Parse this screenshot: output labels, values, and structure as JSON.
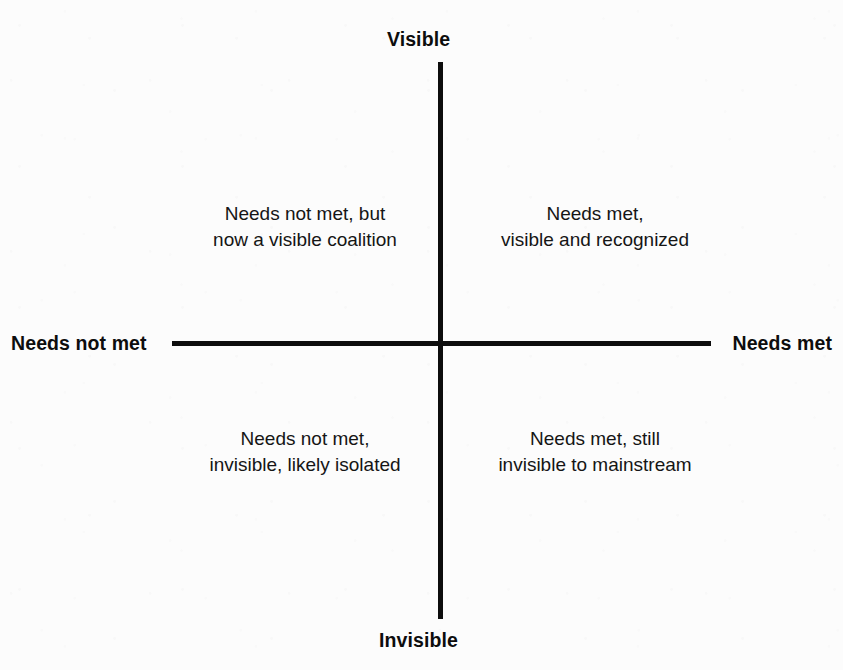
{
  "figure": {
    "kind": "two-by-two-quadrant-diagram",
    "background_color": "#fdfdfd",
    "ink_color": "#0d0d0d"
  },
  "axes": {
    "vertical": {
      "top_label": "Visible",
      "bottom_label": "Invisible"
    },
    "horizontal": {
      "left_label": "Needs not met",
      "right_label": "Needs met"
    }
  },
  "quadrants": {
    "top_left": {
      "line1": "Needs not met, but",
      "line2": "now a visible coalition",
      "text": "Needs not met, but\nnow a visible coalition"
    },
    "top_right": {
      "line1": "Needs met,",
      "line2": "visible and recognized",
      "text": "Needs met,\nvisible and recognized"
    },
    "bottom_left": {
      "line1": "Needs not met,",
      "line2": "invisible, likely isolated",
      "text": "Needs not met,\ninvisible, likely isolated"
    },
    "bottom_right": {
      "line1": "Needs met, still",
      "line2": "invisible to mainstream",
      "text": "Needs met, still\ninvisible to mainstream"
    }
  },
  "chart_data": {
    "type": "scatter",
    "title": "",
    "xlabel": "",
    "ylabel": "",
    "grid": false,
    "legend": null,
    "x_axis": {
      "negative_end_label": "Needs not met",
      "positive_end_label": "Needs met",
      "range": [
        -1,
        1
      ]
    },
    "y_axis": {
      "negative_end_label": "Invisible",
      "positive_end_label": "Visible",
      "range": [
        -1,
        1
      ]
    },
    "annotations": [
      {
        "quadrant": "top-left",
        "x": -0.5,
        "y": 0.5,
        "text": "Needs not met, but now a visible coalition"
      },
      {
        "quadrant": "top-right",
        "x": 0.5,
        "y": 0.5,
        "text": "Needs met, visible and recognized"
      },
      {
        "quadrant": "bottom-left",
        "x": -0.5,
        "y": -0.3,
        "text": "Needs not met, invisible, likely isolated"
      },
      {
        "quadrant": "bottom-right",
        "x": 0.5,
        "y": -0.3,
        "text": "Needs met, still invisible to mainstream"
      }
    ]
  }
}
